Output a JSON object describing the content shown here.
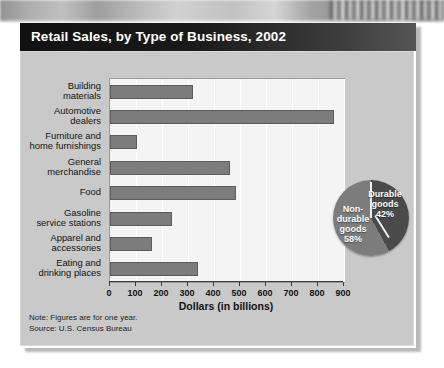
{
  "title": "Retail Sales, by Type of Business, 2002",
  "note_line1": "Note: Figures are for one year.",
  "note_line2": "Source:  U.S. Census Bureau",
  "chart_data": {
    "type": "bar",
    "title": "Retail Sales, by Type of Business, 2002",
    "xlabel": "Dollars (in billions)",
    "ylabel": "",
    "xlim": [
      0,
      900
    ],
    "xticks": [
      "0",
      "100",
      "200",
      "300",
      "400",
      "500",
      "600",
      "700",
      "800",
      "900"
    ],
    "grid": true,
    "orientation": "horizontal",
    "bar_color": "#7c7c7c",
    "categories": [
      "Building materials",
      "Automotive dealers",
      "Furniture and home furnishings",
      "General merchandise",
      "Food",
      "Gasoline service stations",
      "Apparel and accessories",
      "Eating and drinking places"
    ],
    "category_lines": [
      [
        "Building",
        "materials"
      ],
      [
        "Automotive",
        "dealers"
      ],
      [
        "Furniture and",
        "home furnishings"
      ],
      [
        "General",
        "merchandise"
      ],
      [
        "Food"
      ],
      [
        "Gasoline",
        "service stations"
      ],
      [
        "Apparel and",
        "accessories"
      ],
      [
        "Eating and",
        "drinking places"
      ]
    ],
    "values": [
      318,
      860,
      105,
      463,
      486,
      240,
      160,
      338
    ]
  },
  "pie_data": {
    "type": "pie",
    "slices": [
      {
        "label_lines": [
          "Durable",
          "goods"
        ],
        "label": "Durable goods",
        "value": 42,
        "display": "42%",
        "color": "#4a4a4a"
      },
      {
        "label_lines": [
          "Non-",
          "durable",
          "goods"
        ],
        "label": "Non-durable goods",
        "value": 58,
        "display": "58%",
        "color": "#7c7c7c"
      }
    ]
  }
}
